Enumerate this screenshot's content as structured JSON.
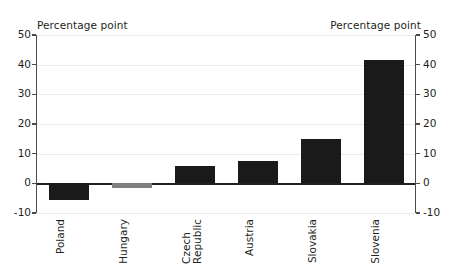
{
  "chart_data": {
    "type": "bar",
    "title": "",
    "subtitle": "",
    "xlabel": "",
    "ylabel": "Percentage point",
    "ylabel_right": "Percentage point",
    "categories": [
      "Poland",
      "Hungary",
      "Czech\nRepublic",
      "Austria",
      "Slovakia",
      "Slovenia"
    ],
    "values": [
      -5.5,
      -1.5,
      5.7,
      7.5,
      15.0,
      41.5
    ],
    "series": [
      {
        "name": "Percentage point change",
        "values": [
          -5.5,
          -1.5,
          5.7,
          7.5,
          15.0,
          41.5
        ]
      }
    ],
    "bar_colors": [
      "#1a1a1a",
      "#7f7f7f",
      "#1a1a1a",
      "#1a1a1a",
      "#1a1a1a",
      "#1a1a1a"
    ],
    "ylim": [
      -10,
      50
    ],
    "yticks": [
      50,
      40,
      30,
      20,
      10,
      0,
      -10
    ],
    "ytick_labels": [
      "50",
      "40",
      "30",
      "20",
      "10",
      "0",
      "-10"
    ],
    "ytick_labels_right": [
      "50",
      "40",
      "30",
      "20",
      "10",
      "0",
      "-10"
    ],
    "grid": true,
    "grid_axis": "y",
    "legend": false,
    "legend_position": "none",
    "dual_axis": true,
    "zero_line": true,
    "background_color": "#ffffff",
    "gridline_color": "#eceaea",
    "axis_color": "#4d4a4a",
    "text_color": "#231f20"
  },
  "axis_labels": {
    "left_unit": "Percentage point",
    "right_unit": "Percentage point"
  }
}
